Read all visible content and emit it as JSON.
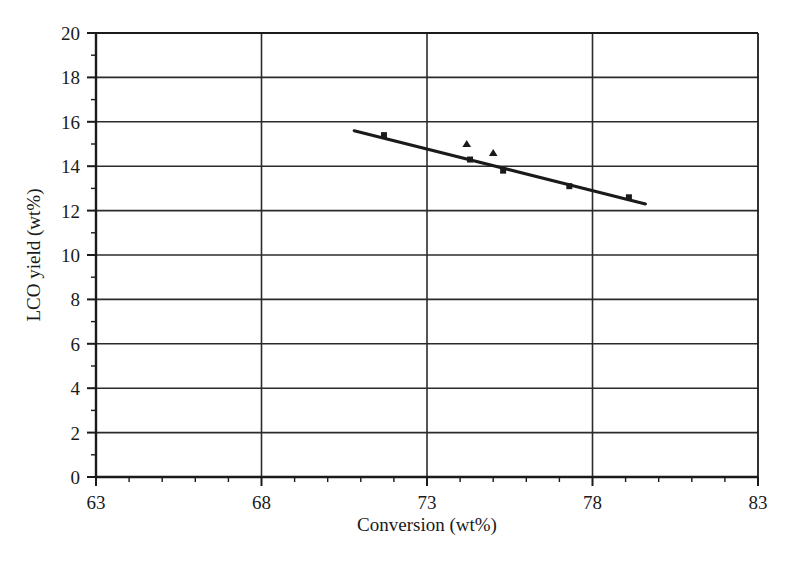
{
  "figure": {
    "background_color": "#ffffff",
    "ink_color": "#1a1a1a",
    "grid_color": "#2b2b2b"
  },
  "chart_data": {
    "type": "scatter",
    "title": "",
    "subtitle": "",
    "xlabel": "Conversion (wt%)",
    "ylabel": "LCO yield (wt%)",
    "xlim": [
      63,
      83
    ],
    "ylim": [
      0,
      20
    ],
    "xticks": [
      63,
      68,
      73,
      78,
      83
    ],
    "xtick_labels": [
      "63",
      "68",
      "73",
      "78",
      "83"
    ],
    "x_minor_tick_step": 1,
    "yticks": [
      0,
      2,
      4,
      6,
      8,
      10,
      12,
      14,
      16,
      18,
      20
    ],
    "ytick_labels": [
      "0",
      "2",
      "4",
      "6",
      "8",
      "10",
      "12",
      "14",
      "16",
      "18",
      "20"
    ],
    "y_minor_tick_step": 1,
    "grid": "horizontal-major-and-vertical-major",
    "legend": "none",
    "legend_position": "none",
    "annotations": [],
    "series": [
      {
        "name": "Series 1",
        "marker": "square",
        "marker_color": "#1a1a1a",
        "marker_size": 6,
        "line": "none",
        "points": [
          {
            "x": 71.7,
            "y": 15.4
          },
          {
            "x": 74.3,
            "y": 14.3
          },
          {
            "x": 75.3,
            "y": 13.8
          },
          {
            "x": 77.3,
            "y": 13.1
          },
          {
            "x": 79.1,
            "y": 12.6
          }
        ]
      },
      {
        "name": "Series 2",
        "marker": "triangle",
        "marker_color": "#1a1a1a",
        "marker_size": 7,
        "line": "none",
        "points": [
          {
            "x": 74.2,
            "y": 15.0
          },
          {
            "x": 75.0,
            "y": 14.6
          }
        ]
      },
      {
        "name": "Trend line",
        "marker": "none",
        "line": "solid",
        "line_color": "#1a1a1a",
        "line_width": 3,
        "points": [
          {
            "x": 70.8,
            "y": 15.6
          },
          {
            "x": 79.6,
            "y": 12.3
          }
        ]
      }
    ]
  }
}
